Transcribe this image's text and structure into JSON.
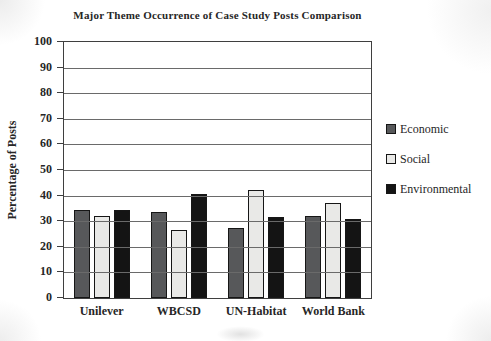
{
  "chart_data": {
    "type": "bar",
    "title": "Major Theme Occurrence of Case Study Posts Comparison",
    "xlabel": "",
    "ylabel": "Percentage of Posts",
    "categories": [
      "Unilever",
      "WBCSD",
      "UN-Habitat",
      "World Bank"
    ],
    "series": [
      {
        "name": "Economic",
        "color": "#57585a",
        "values": [
          34.5,
          33.5,
          27.5,
          32
        ]
      },
      {
        "name": "Social",
        "color": "#e9e9e7",
        "values": [
          32,
          26.5,
          42,
          37
        ]
      },
      {
        "name": "Environmental",
        "color": "#141414",
        "values": [
          34.5,
          40.5,
          31.5,
          31
        ]
      }
    ],
    "ylim": [
      0,
      100
    ],
    "yticks": [
      0,
      10,
      20,
      30,
      40,
      50,
      60,
      70,
      80,
      90,
      100
    ],
    "grid": true,
    "legend_position": "right",
    "bar_border_color": "#161616",
    "colors": {
      "gridline": "#6a6a6a",
      "axis": "#3f3f3f",
      "text": "#262626"
    }
  }
}
